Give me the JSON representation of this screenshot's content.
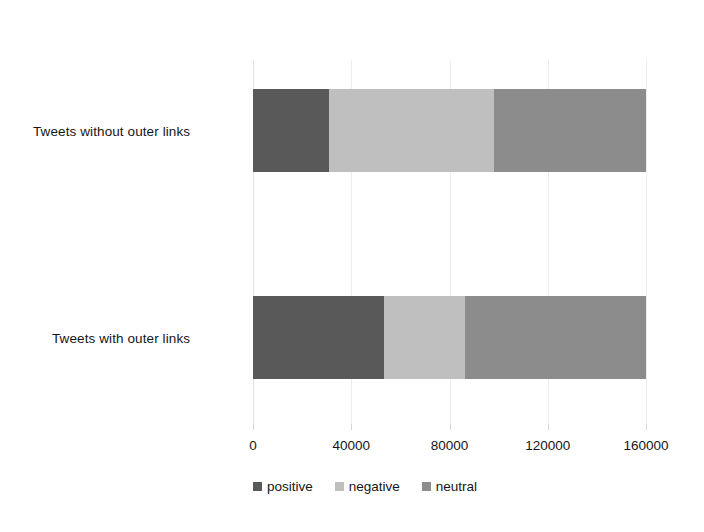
{
  "chart_data": {
    "type": "bar",
    "orientation": "horizontal",
    "stacked": true,
    "title": "",
    "subtitle": "",
    "xlabel": "",
    "ylabel": "",
    "categories": [
      "Tweets without outer links",
      "Tweets with outer links"
    ],
    "series": [
      {
        "name": "positive",
        "color": "#595959",
        "values": [
          31000,
          53500
        ]
      },
      {
        "name": "negative",
        "color": "#bfbfbf",
        "values": [
          67000,
          33000
        ]
      },
      {
        "name": "neutral",
        "color": "#8c8c8c",
        "values": [
          62000,
          73500
        ]
      }
    ],
    "totals": [
      160000,
      160000
    ],
    "xlim": [
      0,
      160000
    ],
    "xticks": [
      0,
      40000,
      80000,
      120000,
      160000
    ],
    "xtick_labels": [
      "0",
      "40000",
      "80000",
      "120000",
      "160000"
    ],
    "grid": true,
    "grid_axis": "x",
    "legend": {
      "position": "bottom",
      "entries": [
        {
          "label": "positive",
          "color": "#595959"
        },
        {
          "label": "negative",
          "color": "#bfbfbf"
        },
        {
          "label": "neutral",
          "color": "#8c8c8c"
        }
      ]
    }
  },
  "colors": {
    "background": "#ffffff",
    "text": "#161616",
    "gridline": "#ededed",
    "tick": "#d6d6d6",
    "positive": "#595959",
    "negative": "#bfbfbf",
    "neutral": "#8c8c8c"
  }
}
